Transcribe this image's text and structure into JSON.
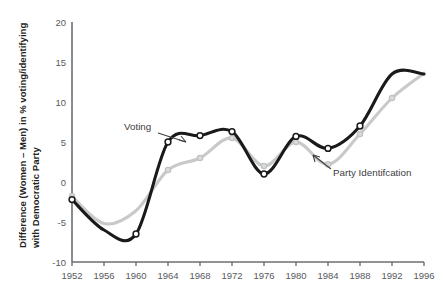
{
  "chart_data": {
    "type": "line",
    "title": "",
    "xlabel": "",
    "ylabel": "Difference (Women – Men) in % voting/identifying with Democratic Party",
    "ylabel_line1": "Difference (Women – Men) in % voting/identifying",
    "ylabel_line2": "with Democratic Party",
    "x": [
      1952,
      1956,
      1960,
      1964,
      1968,
      1972,
      1976,
      1980,
      1984,
      1988,
      1992,
      1996
    ],
    "categories": [
      "1952",
      "1956",
      "1960",
      "1964",
      "1968",
      "1972",
      "1976",
      "1980",
      "1984",
      "1988",
      "1992",
      "1996"
    ],
    "xlim": [
      1952,
      1996
    ],
    "ylim": [
      -10,
      20
    ],
    "yticks": [
      -10,
      -5,
      0,
      5,
      10,
      15,
      20
    ],
    "ytick_labels": [
      "-10",
      "-5",
      "0",
      "5",
      "10",
      "15",
      "20"
    ],
    "xticks": [
      1952,
      1956,
      1960,
      1964,
      1968,
      1972,
      1976,
      1980,
      1984,
      1988,
      1992,
      1996
    ],
    "xtick_labels": [
      "1952",
      "1956",
      "1960",
      "1964",
      "1968",
      "1972",
      "1976",
      "1980",
      "1984",
      "1988",
      "1992",
      "1996"
    ],
    "grid": false,
    "legend": "annotations",
    "series": [
      {
        "name": "Voting",
        "color": "#1a1a1a",
        "marker": "open-circle",
        "values": [
          -2.2,
          -6.0,
          -6.5,
          5.0,
          5.8,
          6.3,
          1.0,
          5.7,
          4.2,
          7.0,
          13.5,
          13.5
        ],
        "marked_points": [
          1952,
          1960,
          1964,
          1968,
          1972,
          1976,
          1980,
          1984,
          1988
        ]
      },
      {
        "name": "Party Identifcation",
        "color": "#c8c9ca",
        "marker": "filled-circle",
        "values": [
          -1.8,
          -5.2,
          -3.6,
          1.5,
          3.0,
          5.5,
          2.0,
          5.0,
          2.2,
          6.0,
          10.5,
          13.6
        ],
        "marked_points": [
          1952,
          1964,
          1968,
          1972,
          1976,
          1980,
          1984,
          1988,
          1992
        ]
      }
    ],
    "annotations": [
      {
        "id": "voting-annotation",
        "text": "Voting",
        "points_to_series": "Voting"
      },
      {
        "id": "party-annotation",
        "text": "Party Identifcation",
        "points_to_series": "Party Identifcation"
      }
    ],
    "colors": {
      "voting": "#1a1a1a",
      "party_identification": "#c8c9ca",
      "axis": "#6d6e71",
      "tick_text": "#58595b",
      "annotation_text": "#404041",
      "background": "#ffffff"
    }
  }
}
